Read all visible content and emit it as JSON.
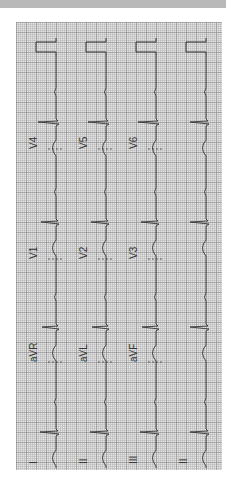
{
  "document": {
    "type": "12-lead ECG printout (rotated 90°)",
    "colors": {
      "paper": "#e4e4e4",
      "grid": "#8c8c8c",
      "trace": "#333333",
      "header_bar": "#b9b9b9"
    }
  },
  "leads": {
    "columns": [
      {
        "name": "column-1",
        "labels": [
          "I",
          "aVR",
          "V1",
          "V4"
        ]
      },
      {
        "name": "column-2",
        "labels": [
          "II",
          "aVL",
          "V2",
          "V5"
        ]
      },
      {
        "name": "column-3",
        "labels": [
          "III",
          "aVF",
          "V3",
          "V6"
        ]
      },
      {
        "name": "rhythm-strip",
        "labels": [
          "II"
        ]
      }
    ]
  },
  "label_text": {
    "c1_I": "I",
    "c1_aVR": "aVR",
    "c1_V1": "V1",
    "c1_V4": "V4",
    "c2_II": "II",
    "c2_aVL": "aVL",
    "c2_V2": "V2",
    "c2_V5": "V5",
    "c3_III": "III",
    "c3_aVF": "aVF",
    "c3_V3": "V3",
    "c3_V6": "V6",
    "c4_II": "II"
  },
  "beats_per_strip": 4
}
